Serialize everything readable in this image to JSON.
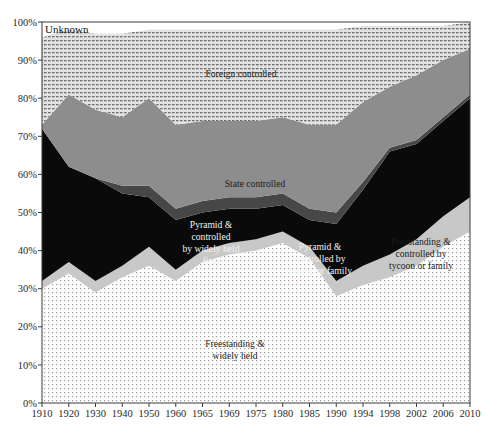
{
  "chart_data": {
    "type": "area",
    "title": "",
    "subtitle": "",
    "xlabel": "",
    "ylabel": "",
    "stacked": true,
    "normalized": true,
    "grid": false,
    "legend_position": "inline-labels",
    "ylim": [
      0,
      100
    ],
    "ytick_labels": [
      "0%",
      "10%",
      "20%",
      "30%",
      "40%",
      "50%",
      "60%",
      "70%",
      "80%",
      "90%",
      "100%"
    ],
    "ytick_values": [
      0,
      10,
      20,
      30,
      40,
      50,
      60,
      70,
      80,
      90,
      100
    ],
    "categories": [
      "1910",
      "1920",
      "1930",
      "1940",
      "1950",
      "1960",
      "1965",
      "1969",
      "1975",
      "1980",
      "1985",
      "1990",
      "1994",
      "1998",
      "2002",
      "2006",
      "2010"
    ],
    "series": [
      {
        "name": "Freestanding & widely held",
        "label": "Freestanding &\nwidely held",
        "color": "#ffffff",
        "pattern": "fine-dot",
        "values": [
          30,
          34,
          29,
          33,
          36,
          32,
          37,
          39,
          40,
          42,
          38,
          28,
          31,
          33,
          36,
          41,
          45
        ]
      },
      {
        "name": "Freestanding & controlled by tycoon or family",
        "label": "Freestanding &\ncontrolled by\ntycoon or family",
        "color": "#c8c8c8",
        "pattern": "solid",
        "values": [
          2,
          3,
          3,
          3,
          5,
          3,
          3,
          3,
          3,
          3,
          3,
          4,
          5,
          6,
          7,
          8,
          9
        ]
      },
      {
        "name": "Pyramid & controlled by tycoon or family",
        "label": "Pyramid &\ncontrolled by\ntycoon or family",
        "color": "#0a0a0a",
        "pattern": "solid",
        "values": [
          40,
          25,
          27,
          19,
          13,
          13,
          10,
          9,
          8,
          7,
          7,
          15,
          20,
          27,
          25,
          25,
          26
        ]
      },
      {
        "name": "Pyramid & controlled by widely held firm",
        "label": "Pyramid &\ncontrolled\nby widely held\nfirm",
        "color": "#474747",
        "pattern": "solid",
        "values": [
          0,
          0,
          0,
          2,
          3,
          3,
          3,
          3,
          3,
          3,
          3,
          3,
          2,
          1,
          1,
          1,
          1
        ]
      },
      {
        "name": "State controlled",
        "label": "State controlled",
        "color": "#8d8d8d",
        "pattern": "solid",
        "values": [
          1,
          19,
          18,
          18,
          23,
          22,
          21,
          20,
          20,
          20,
          22,
          23,
          21,
          16,
          17,
          15,
          12
        ]
      },
      {
        "name": "Foreign controlled",
        "label": "Foreign controlled",
        "color": "#d9d9d9",
        "pattern": "hatch",
        "values": [
          23,
          17,
          20,
          22,
          18,
          25,
          24,
          24,
          24,
          23,
          25,
          25,
          20,
          16,
          13,
          9,
          7
        ]
      },
      {
        "name": "Unknown",
        "label": "Unknown",
        "color": "#ffffff",
        "pattern": "solid",
        "values": [
          4,
          2,
          3,
          3,
          2,
          2,
          2,
          2,
          2,
          2,
          2,
          2,
          1,
          1,
          1,
          1,
          0
        ]
      }
    ]
  },
  "axis": {
    "y_labels": [
      "100%",
      "90%",
      "80%",
      "70%",
      "60%",
      "50%",
      "40%",
      "30%",
      "20%",
      "10%",
      "0%"
    ],
    "x_labels": [
      "1910",
      "1920",
      "1930",
      "1940",
      "1950",
      "1960",
      "1965",
      "1969",
      "1975",
      "1980",
      "1985",
      "1990",
      "1994",
      "1998",
      "2002",
      "2006",
      "2010"
    ]
  },
  "band_labels": {
    "unknown": "Unknown",
    "foreign": "Foreign controlled",
    "state": "State controlled",
    "pyramid_widely_held": [
      "Pyramid &",
      "controlled",
      "by widely held",
      "firm"
    ],
    "pyramid_tycoon": [
      "Pyramid &",
      "controlled by",
      "tycoon or family"
    ],
    "freestanding_tycoon": [
      "Freestanding &",
      "controlled by",
      "tycoon or family"
    ],
    "freestanding_widely_held": [
      "Freestanding &",
      "widely held"
    ]
  }
}
